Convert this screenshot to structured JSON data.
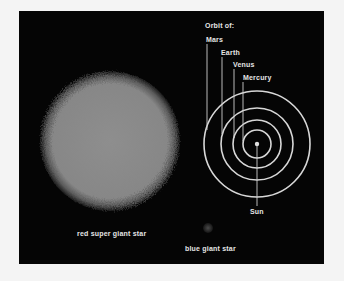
{
  "diagram": {
    "orbit_heading": "Orbit of:",
    "orbits": [
      {
        "label": "Mars",
        "radius": 53
      },
      {
        "label": "Earth",
        "radius": 36
      },
      {
        "label": "Venus",
        "radius": 24
      },
      {
        "label": "Mercury",
        "radius": 14
      }
    ],
    "sun_label": "Sun",
    "red_super_giant_label": "red super giant star",
    "blue_giant_label": "blue giant star"
  },
  "colors": {
    "background": "#f4f4f4",
    "panel": "#050505",
    "ring": "#d8d8d8",
    "text": "#e6e6e6",
    "red_super_giant": "#8a8a8a",
    "blue_giant": "#3a3a3a"
  }
}
